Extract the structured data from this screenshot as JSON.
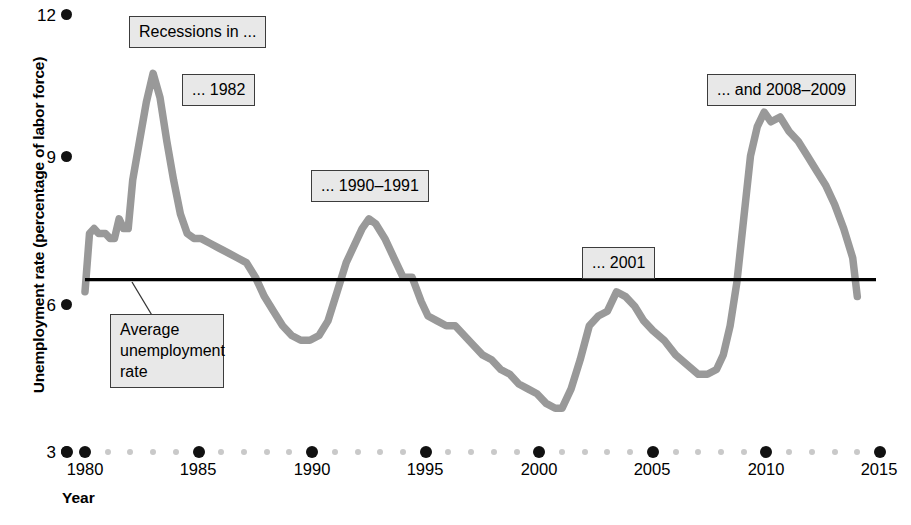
{
  "chart_data": {
    "type": "line",
    "title": "",
    "xlabel": "Year",
    "ylabel": "Unemployment rate (percentage of labor force)",
    "xlim": [
      1980,
      2015
    ],
    "ylim": [
      3,
      12
    ],
    "grid": false,
    "legend": "none",
    "y_ticks": [
      "12",
      "9",
      "6",
      "3"
    ],
    "y_tick_values": [
      12,
      9,
      6,
      3
    ],
    "x_ticks": [
      "1980",
      "1985",
      "1990",
      "1995",
      "2000",
      "2005",
      "2010",
      "2015"
    ],
    "x_tick_values": [
      1980,
      1985,
      1990,
      1995,
      2000,
      2005,
      2010,
      2015
    ],
    "line_color": "#999999",
    "average_line_color": "#000000",
    "average_unemployment_rate": 6.55,
    "series": [
      {
        "name": "Unemployment rate",
        "x": [
          1980.0,
          1980.2,
          1980.4,
          1980.6,
          1980.9,
          1981.1,
          1981.3,
          1981.5,
          1981.7,
          1981.9,
          1982.1,
          1982.4,
          1982.7,
          1983.0,
          1983.3,
          1983.6,
          1983.9,
          1984.2,
          1984.5,
          1984.8,
          1985.1,
          1985.5,
          1985.9,
          1986.3,
          1986.7,
          1987.1,
          1987.5,
          1987.9,
          1988.3,
          1988.7,
          1989.1,
          1989.5,
          1989.9,
          1990.3,
          1990.7,
          1991.1,
          1991.5,
          1991.9,
          1992.2,
          1992.5,
          1992.8,
          1993.2,
          1993.6,
          1994.0,
          1994.4,
          1994.8,
          1995.1,
          1995.5,
          1995.9,
          1996.3,
          1996.7,
          1997.1,
          1997.5,
          1997.9,
          1998.3,
          1998.7,
          1999.1,
          1999.5,
          1999.9,
          2000.3,
          2000.7,
          2001.0,
          2001.4,
          2001.8,
          2002.2,
          2002.6,
          2003.0,
          2003.4,
          2003.8,
          2004.2,
          2004.6,
          2005.0,
          2005.5,
          2006.0,
          2006.5,
          2007.0,
          2007.4,
          2007.8,
          2008.1,
          2008.4,
          2008.7,
          2009.0,
          2009.3,
          2009.6,
          2009.9,
          2010.2,
          2010.6,
          2011.0,
          2011.4,
          2011.8,
          2012.2,
          2012.6,
          2013.0,
          2013.4,
          2013.8,
          2014.0
        ],
        "values": [
          6.3,
          7.5,
          7.6,
          7.5,
          7.5,
          7.4,
          7.4,
          7.8,
          7.6,
          7.6,
          8.6,
          9.4,
          10.2,
          10.8,
          10.3,
          9.4,
          8.6,
          7.9,
          7.5,
          7.4,
          7.4,
          7.3,
          7.2,
          7.1,
          7.0,
          6.9,
          6.6,
          6.2,
          5.9,
          5.6,
          5.4,
          5.3,
          5.3,
          5.4,
          5.7,
          6.3,
          6.9,
          7.3,
          7.6,
          7.8,
          7.7,
          7.4,
          7.0,
          6.6,
          6.6,
          6.1,
          5.8,
          5.7,
          5.6,
          5.6,
          5.4,
          5.2,
          5.0,
          4.9,
          4.7,
          4.6,
          4.4,
          4.3,
          4.2,
          4.0,
          3.9,
          3.9,
          4.3,
          4.9,
          5.6,
          5.8,
          5.9,
          6.3,
          6.2,
          6.0,
          5.7,
          5.5,
          5.3,
          5.0,
          4.8,
          4.6,
          4.6,
          4.7,
          5.0,
          5.6,
          6.5,
          7.8,
          9.1,
          9.7,
          10.0,
          9.8,
          9.9,
          9.6,
          9.4,
          9.1,
          8.8,
          8.5,
          8.1,
          7.6,
          7.0,
          6.2
        ]
      }
    ],
    "annotations": [
      {
        "id": "recessions-in",
        "text": "Recessions in ..."
      },
      {
        "id": "rec-1982",
        "text": "... 1982"
      },
      {
        "id": "rec-1990-1991",
        "text": "... 1990–1991"
      },
      {
        "id": "rec-2001",
        "text": "... 2001"
      },
      {
        "id": "rec-2008-2009",
        "text": "... and 2008–2009"
      },
      {
        "id": "average-callout",
        "text": "Average unemployment rate"
      }
    ]
  }
}
